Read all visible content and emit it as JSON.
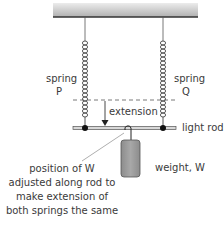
{
  "diagram": {
    "labels": {
      "spring_p_line1": "spring",
      "spring_p_line2": "P",
      "spring_q_line1": "spring",
      "spring_q_line2": "Q",
      "extension": "extension",
      "light_rod": "light rod",
      "weight": "weight, W",
      "note_line1": "position of W",
      "note_line2": "adjusted along rod to",
      "note_line3": "make extension of",
      "note_line4": "both springs the same"
    },
    "colors": {
      "line": "#444444",
      "ceiling_top": "#e6e6e6",
      "ceiling_bottom": "#b5b5b5",
      "weight_fill": "#9a9a9a",
      "rod_fill": "#d0d0d0"
    }
  }
}
